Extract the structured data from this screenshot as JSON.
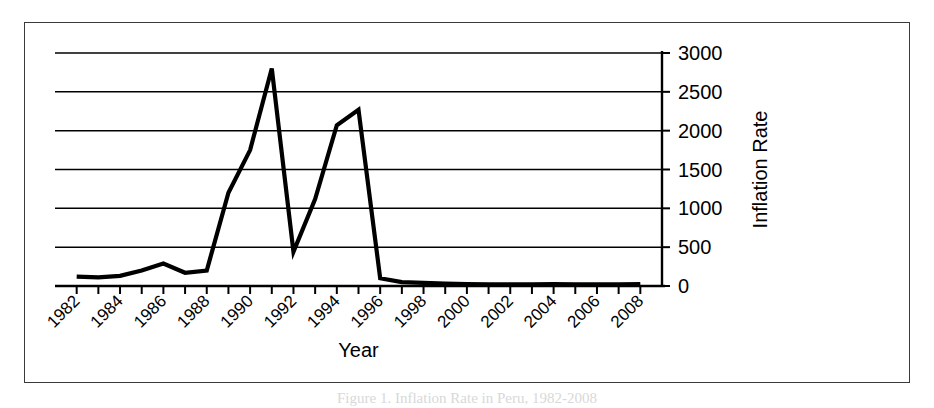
{
  "figure": {
    "caption": "Figure 1. Inflation Rate in Peru, 1982-2008"
  },
  "chart_data": {
    "type": "line",
    "title": "",
    "xlabel": "Year",
    "ylabel": "Inflation Rate",
    "xlim": [
      1981,
      2009
    ],
    "ylim": [
      0,
      3000
    ],
    "grid": true,
    "legend": "none",
    "y_ticks": [
      0,
      500,
      1000,
      1500,
      2000,
      2500,
      3000
    ],
    "y_tick_labels": [
      "0",
      "500",
      "1000",
      "1500",
      "2000",
      "2500",
      "3000"
    ],
    "y_axis_position": "right",
    "x_tick_labels": [
      "1982",
      "1984",
      "1986",
      "1988",
      "1990",
      "1992",
      "1994",
      "1996",
      "1998",
      "2000",
      "2002",
      "2004",
      "2006",
      "2008"
    ],
    "x_tick_label_rotation": 45,
    "series": [
      {
        "name": "Inflation Rate",
        "color": "#000000",
        "x": [
          1982,
          1983,
          1984,
          1985,
          1986,
          1987,
          1988,
          1989,
          1990,
          1991,
          1992,
          1993,
          1994,
          1995,
          1996,
          1997,
          1998,
          1999,
          2000,
          2001,
          2002,
          2003,
          2004,
          2005,
          2006,
          2007,
          2008
        ],
        "values": [
          120,
          110,
          130,
          200,
          290,
          170,
          200,
          1200,
          1750,
          2800,
          440,
          1120,
          2070,
          2270,
          100,
          50,
          40,
          30,
          25,
          20,
          20,
          20,
          25,
          20,
          20,
          20,
          25
        ]
      }
    ]
  }
}
